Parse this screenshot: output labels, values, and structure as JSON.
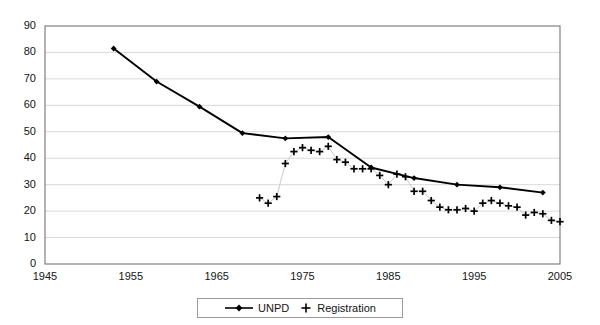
{
  "chart_data": {
    "type": "line",
    "title": "",
    "xlabel": "",
    "ylabel": "",
    "xlim": [
      1945,
      2005
    ],
    "ylim": [
      0,
      90
    ],
    "xticks": [
      1945,
      1955,
      1965,
      1975,
      1985,
      1995,
      2005
    ],
    "yticks": [
      0,
      10,
      20,
      30,
      40,
      50,
      60,
      70,
      80,
      90
    ],
    "grid": "horizontal",
    "legend_position": "bottom-center",
    "series": [
      {
        "name": "UNPD",
        "marker": "diamond",
        "line": "solid",
        "color": "#000000",
        "points": [
          {
            "x": 1953,
            "y": 81.5
          },
          {
            "x": 1958,
            "y": 69.0
          },
          {
            "x": 1963,
            "y": 59.5
          },
          {
            "x": 1968,
            "y": 49.5
          },
          {
            "x": 1973,
            "y": 47.5
          },
          {
            "x": 1978,
            "y": 48.0
          },
          {
            "x": 1983,
            "y": 36.5
          },
          {
            "x": 1988,
            "y": 32.5
          },
          {
            "x": 1993,
            "y": 30.0
          },
          {
            "x": 1998,
            "y": 29.0
          },
          {
            "x": 2003,
            "y": 27.0
          }
        ]
      },
      {
        "name": "Registration",
        "marker": "plus",
        "line": "thin-gray",
        "color": "#000000",
        "points": [
          {
            "x": 1970,
            "y": 25.0
          },
          {
            "x": 1971,
            "y": 23.0
          },
          {
            "x": 1972,
            "y": 25.5
          },
          {
            "x": 1973,
            "y": 38.0
          },
          {
            "x": 1974,
            "y": 42.5
          },
          {
            "x": 1975,
            "y": 44.0
          },
          {
            "x": 1976,
            "y": 43.0
          },
          {
            "x": 1977,
            "y": 42.5
          },
          {
            "x": 1978,
            "y": 44.5
          },
          {
            "x": 1979,
            "y": 39.5
          },
          {
            "x": 1980,
            "y": 38.5
          },
          {
            "x": 1981,
            "y": 36.0
          },
          {
            "x": 1982,
            "y": 36.0
          },
          {
            "x": 1983,
            "y": 36.0
          },
          {
            "x": 1984,
            "y": 33.5
          },
          {
            "x": 1985,
            "y": 30.0
          },
          {
            "x": 1986,
            "y": 34.0
          },
          {
            "x": 1987,
            "y": 33.0
          },
          {
            "x": 1988,
            "y": 27.5
          },
          {
            "x": 1989,
            "y": 27.5
          },
          {
            "x": 1990,
            "y": 24.0
          },
          {
            "x": 1991,
            "y": 21.5
          },
          {
            "x": 1992,
            "y": 20.5
          },
          {
            "x": 1993,
            "y": 20.5
          },
          {
            "x": 1994,
            "y": 21.0
          },
          {
            "x": 1995,
            "y": 20.0
          },
          {
            "x": 1996,
            "y": 23.0
          },
          {
            "x": 1997,
            "y": 24.0
          },
          {
            "x": 1998,
            "y": 23.0
          },
          {
            "x": 1999,
            "y": 22.0
          },
          {
            "x": 2000,
            "y": 21.5
          },
          {
            "x": 2001,
            "y": 18.5
          },
          {
            "x": 2002,
            "y": 19.5
          },
          {
            "x": 2003,
            "y": 19.0
          },
          {
            "x": 2004,
            "y": 16.5
          },
          {
            "x": 2005,
            "y": 16.0
          },
          {
            "x": 2006,
            "y": 16.0
          },
          {
            "x": 2007,
            "y": 15.5
          }
        ]
      }
    ]
  },
  "axes": {
    "y_tick_labels": [
      "90",
      "80",
      "70",
      "60",
      "50",
      "40",
      "30",
      "20",
      "10",
      "0"
    ],
    "x_tick_labels": [
      "1945",
      "1955",
      "1965",
      "1975",
      "1985",
      "1995",
      "2005"
    ]
  },
  "legend": {
    "items": [
      {
        "label": "UNPD",
        "marker": "line-diamond-marker"
      },
      {
        "label": "Registration",
        "marker": "plus-marker"
      }
    ]
  },
  "style": {
    "plot_border": "#808080",
    "gridline": "#d9d9d9",
    "series_color": "#000000",
    "background": "#ffffff"
  }
}
